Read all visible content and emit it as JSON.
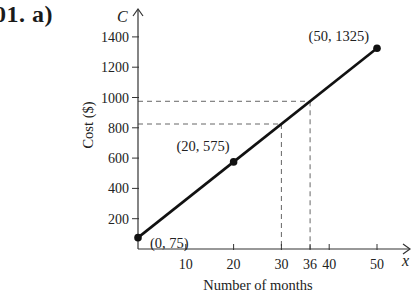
{
  "problem": {
    "label": "01. a)"
  },
  "chart_data": {
    "type": "line",
    "title": "",
    "xlabel": "Number of months",
    "ylabel": "Cost ($)",
    "x_var": "x",
    "y_var": "C",
    "xlim": [
      0,
      55
    ],
    "ylim": [
      0,
      1500
    ],
    "grid": false,
    "x_ticks": [
      10,
      20,
      30,
      36,
      40,
      50
    ],
    "y_ticks": [
      200,
      400,
      600,
      800,
      1000,
      1200,
      1400
    ],
    "series": [
      {
        "name": "Cost",
        "x": [
          0,
          20,
          50
        ],
        "y": [
          75,
          575,
          1325
        ],
        "equation": "C = 75 + 25x"
      }
    ],
    "points": [
      {
        "x": 0,
        "y": 75,
        "label": "(0, 75)"
      },
      {
        "x": 20,
        "y": 575,
        "label": "(20, 575)"
      },
      {
        "x": 50,
        "y": 1325,
        "label": "(50, 1325)"
      }
    ],
    "annotations": [
      {
        "type": "dashed-reference",
        "x": 30,
        "y": 825
      },
      {
        "type": "dashed-reference",
        "x": 36,
        "y": 975
      }
    ]
  }
}
